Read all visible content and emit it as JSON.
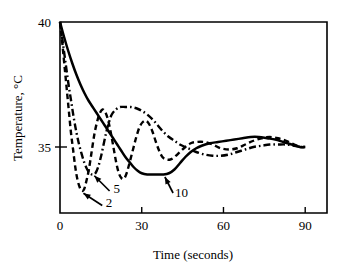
{
  "chart_data": {
    "type": "line",
    "title": "",
    "xlabel": "Time (seconds)",
    "ylabel": "Temperature, °C",
    "xlim": [
      0,
      98
    ],
    "ylim": [
      32.36,
      40
    ],
    "xticks": [
      0,
      30,
      60,
      90
    ],
    "xticklabels": [
      "0",
      "30",
      "60",
      "90"
    ],
    "yticks": [
      35,
      40
    ],
    "yticklabels": [
      "35",
      "40"
    ],
    "grid": false,
    "legend_position": "inline-annotations",
    "annotations": [
      {
        "label": "2",
        "style": "dashed",
        "note": "curve label with leader arrow"
      },
      {
        "label": "5",
        "style": "dash-dot",
        "note": "curve label with leader arrow"
      },
      {
        "label": "10",
        "style": "solid",
        "note": "curve label with leader arrow"
      }
    ],
    "series": [
      {
        "name": "2",
        "style": "dashed",
        "points": [
          [
            0,
            40.0
          ],
          [
            0.8,
            39.2
          ],
          [
            1.6,
            38.3
          ],
          [
            2.4,
            37.4
          ],
          [
            3.2,
            36.5
          ],
          [
            4.0,
            35.6
          ],
          [
            4.8,
            34.9
          ],
          [
            5.6,
            34.2
          ],
          [
            6.4,
            33.7
          ],
          [
            7.2,
            33.4
          ],
          [
            8.0,
            33.25
          ],
          [
            8.8,
            33.3
          ],
          [
            9.6,
            33.6
          ],
          [
            10.6,
            34.1
          ],
          [
            11.6,
            34.8
          ],
          [
            12.6,
            35.5
          ],
          [
            13.6,
            36.0
          ],
          [
            14.6,
            36.35
          ],
          [
            15.6,
            36.5
          ],
          [
            16.6,
            36.4
          ],
          [
            17.6,
            36.1
          ],
          [
            18.6,
            35.6
          ],
          [
            19.6,
            35.0
          ],
          [
            20.6,
            34.4
          ],
          [
            21.6,
            33.95
          ],
          [
            22.6,
            33.75
          ],
          [
            23.6,
            33.75
          ],
          [
            24.6,
            34.0
          ],
          [
            25.6,
            34.4
          ],
          [
            26.8,
            34.9
          ],
          [
            28.0,
            35.4
          ],
          [
            29.2,
            35.8
          ],
          [
            30.4,
            36.0
          ],
          [
            31.6,
            36.05
          ],
          [
            32.8,
            35.9
          ],
          [
            34.0,
            35.6
          ],
          [
            35.2,
            35.2
          ],
          [
            36.4,
            34.85
          ],
          [
            37.6,
            34.6
          ],
          [
            39.0,
            34.5
          ],
          [
            40.5,
            34.5
          ],
          [
            42.0,
            34.6
          ],
          [
            44.0,
            34.8
          ],
          [
            46.0,
            35.0
          ],
          [
            48.0,
            35.15
          ],
          [
            50.0,
            35.2
          ],
          [
            53.0,
            35.2
          ],
          [
            56.0,
            35.1
          ],
          [
            59.0,
            34.95
          ],
          [
            62.0,
            34.9
          ],
          [
            65.0,
            34.95
          ],
          [
            68.0,
            35.1
          ],
          [
            71.0,
            35.25
          ],
          [
            74.0,
            35.35
          ],
          [
            77.0,
            35.4
          ],
          [
            80.0,
            35.35
          ],
          [
            83.0,
            35.25
          ],
          [
            86.0,
            35.1
          ],
          [
            88.5,
            35.0
          ],
          [
            90.0,
            35.0
          ]
        ]
      },
      {
        "name": "5",
        "style": "dash-dot",
        "points": [
          [
            0,
            40.0
          ],
          [
            1.0,
            39.2
          ],
          [
            2.0,
            38.4
          ],
          [
            3.0,
            37.6
          ],
          [
            4.0,
            36.9
          ],
          [
            5.0,
            36.2
          ],
          [
            6.0,
            35.6
          ],
          [
            7.0,
            35.1
          ],
          [
            8.0,
            34.7
          ],
          [
            9.0,
            34.35
          ],
          [
            10.0,
            34.1
          ],
          [
            11.0,
            33.95
          ],
          [
            12.0,
            33.9
          ],
          [
            13.0,
            33.95
          ],
          [
            14.0,
            34.2
          ],
          [
            15.0,
            34.6
          ],
          [
            16.0,
            35.1
          ],
          [
            17.0,
            35.6
          ],
          [
            18.0,
            36.0
          ],
          [
            19.0,
            36.3
          ],
          [
            20.5,
            36.5
          ],
          [
            22.0,
            36.6
          ],
          [
            24.0,
            36.6
          ],
          [
            26.0,
            36.6
          ],
          [
            28.0,
            36.55
          ],
          [
            30.0,
            36.45
          ],
          [
            32.0,
            36.3
          ],
          [
            34.0,
            36.1
          ],
          [
            36.0,
            35.85
          ],
          [
            38.0,
            35.6
          ],
          [
            40.0,
            35.4
          ],
          [
            42.0,
            35.25
          ],
          [
            44.0,
            35.1
          ],
          [
            46.0,
            35.0
          ],
          [
            48.0,
            34.9
          ],
          [
            50.0,
            34.8
          ],
          [
            53.0,
            34.7
          ],
          [
            56.0,
            34.65
          ],
          [
            59.0,
            34.65
          ],
          [
            62.0,
            34.7
          ],
          [
            65.0,
            34.8
          ],
          [
            68.0,
            34.9
          ],
          [
            71.0,
            35.0
          ],
          [
            74.0,
            35.05
          ],
          [
            77.0,
            35.1
          ],
          [
            80.0,
            35.1
          ],
          [
            83.0,
            35.1
          ],
          [
            86.0,
            35.05
          ],
          [
            88.5,
            35.0
          ],
          [
            90.0,
            35.0
          ]
        ]
      },
      {
        "name": "10",
        "style": "solid",
        "points": [
          [
            0,
            40.0
          ],
          [
            1.5,
            39.4
          ],
          [
            3.0,
            38.85
          ],
          [
            4.5,
            38.35
          ],
          [
            6.0,
            37.9
          ],
          [
            7.5,
            37.5
          ],
          [
            9.0,
            37.15
          ],
          [
            10.5,
            36.85
          ],
          [
            12.0,
            36.6
          ],
          [
            13.5,
            36.35
          ],
          [
            15.0,
            36.1
          ],
          [
            16.5,
            35.85
          ],
          [
            18.0,
            35.6
          ],
          [
            19.5,
            35.35
          ],
          [
            21.0,
            35.1
          ],
          [
            22.5,
            34.85
          ],
          [
            24.0,
            34.6
          ],
          [
            25.5,
            34.4
          ],
          [
            27.0,
            34.2
          ],
          [
            28.5,
            34.05
          ],
          [
            30.0,
            33.95
          ],
          [
            32.0,
            33.9
          ],
          [
            34.0,
            33.9
          ],
          [
            36.0,
            33.9
          ],
          [
            38.0,
            33.9
          ],
          [
            40.0,
            33.95
          ],
          [
            42.0,
            34.1
          ],
          [
            44.0,
            34.35
          ],
          [
            46.0,
            34.6
          ],
          [
            48.0,
            34.8
          ],
          [
            50.0,
            34.95
          ],
          [
            52.0,
            35.05
          ],
          [
            55.0,
            35.15
          ],
          [
            58.0,
            35.2
          ],
          [
            61.0,
            35.25
          ],
          [
            64.0,
            35.3
          ],
          [
            67.0,
            35.35
          ],
          [
            70.0,
            35.4
          ],
          [
            73.0,
            35.4
          ],
          [
            76.0,
            35.35
          ],
          [
            79.0,
            35.3
          ],
          [
            82.0,
            35.2
          ],
          [
            85.0,
            35.1
          ],
          [
            88.0,
            35.0
          ],
          [
            90.0,
            35.0
          ]
        ]
      }
    ]
  }
}
